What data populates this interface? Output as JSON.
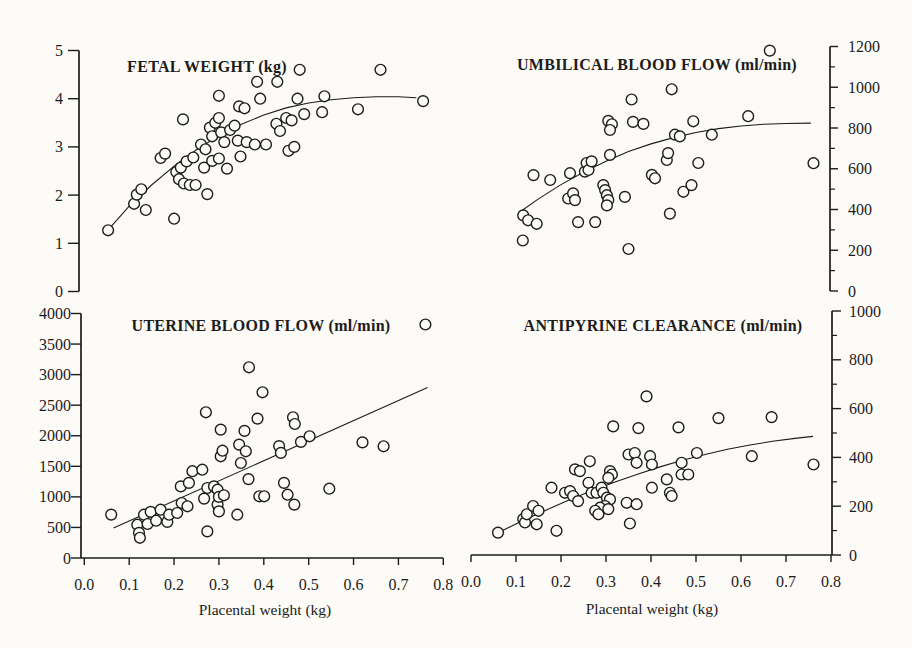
{
  "colors": {
    "ink": "#1c1c1c",
    "paper": "#fcfbf7"
  },
  "chart_data": [
    {
      "type": "scatter",
      "id": "fetal-weight",
      "title": "FETAL WEIGHT (kg)",
      "marker": "open-circle",
      "xlim": [
        0,
        0.8
      ],
      "ylim": [
        0,
        5
      ],
      "yticks": [
        0,
        1,
        2,
        3,
        4,
        5
      ],
      "ytick_labels": [
        "0",
        "1",
        "2",
        "3",
        "4",
        "5"
      ],
      "points": [
        [
          0.053,
          1.27
        ],
        [
          0.111,
          1.82
        ],
        [
          0.117,
          2.01
        ],
        [
          0.127,
          2.12
        ],
        [
          0.137,
          1.69
        ],
        [
          0.2,
          1.51
        ],
        [
          0.17,
          2.77
        ],
        [
          0.18,
          2.86
        ],
        [
          0.205,
          2.48
        ],
        [
          0.215,
          2.57
        ],
        [
          0.228,
          2.7
        ],
        [
          0.243,
          2.78
        ],
        [
          0.211,
          2.33
        ],
        [
          0.222,
          2.24
        ],
        [
          0.235,
          2.21
        ],
        [
          0.248,
          2.21
        ],
        [
          0.274,
          2.02
        ],
        [
          0.267,
          2.57
        ],
        [
          0.285,
          2.71
        ],
        [
          0.22,
          3.57
        ],
        [
          0.26,
          3.05
        ],
        [
          0.27,
          2.95
        ],
        [
          0.28,
          3.4
        ],
        [
          0.285,
          3.22
        ],
        [
          0.292,
          3.5
        ],
        [
          0.3,
          3.6
        ],
        [
          0.305,
          3.3
        ],
        [
          0.312,
          3.1
        ],
        [
          0.3,
          2.76
        ],
        [
          0.318,
          2.55
        ],
        [
          0.325,
          3.35
        ],
        [
          0.335,
          3.44
        ],
        [
          0.342,
          3.13
        ],
        [
          0.348,
          2.8
        ],
        [
          0.362,
          3.1
        ],
        [
          0.38,
          3.05
        ],
        [
          0.405,
          3.05
        ],
        [
          0.428,
          3.48
        ],
        [
          0.436,
          3.33
        ],
        [
          0.45,
          3.6
        ],
        [
          0.462,
          3.55
        ],
        [
          0.455,
          2.92
        ],
        [
          0.468,
          3.0
        ],
        [
          0.49,
          3.68
        ],
        [
          0.53,
          3.72
        ],
        [
          0.61,
          3.78
        ],
        [
          0.3,
          4.06
        ],
        [
          0.345,
          3.84
        ],
        [
          0.357,
          3.8
        ],
        [
          0.385,
          4.35
        ],
        [
          0.392,
          4.0
        ],
        [
          0.43,
          4.35
        ],
        [
          0.475,
          4.0
        ],
        [
          0.48,
          4.6
        ],
        [
          0.535,
          4.05
        ],
        [
          0.66,
          4.6
        ],
        [
          0.755,
          3.95
        ]
      ],
      "curve": [
        [
          0.055,
          1.3
        ],
        [
          0.1,
          1.77
        ],
        [
          0.15,
          2.21
        ],
        [
          0.2,
          2.6
        ],
        [
          0.25,
          2.94
        ],
        [
          0.3,
          3.23
        ],
        [
          0.35,
          3.47
        ],
        [
          0.4,
          3.66
        ],
        [
          0.45,
          3.81
        ],
        [
          0.5,
          3.91
        ],
        [
          0.55,
          3.98
        ],
        [
          0.6,
          4.02
        ],
        [
          0.65,
          4.04
        ],
        [
          0.7,
          4.04
        ],
        [
          0.74,
          4.02
        ]
      ]
    },
    {
      "type": "scatter",
      "id": "umbilical-blood-flow",
      "title": "UMBILICAL BLOOD FLOW (ml/min)",
      "marker": "open-circle",
      "xlim": [
        0,
        0.8
      ],
      "ylim": [
        0,
        1200
      ],
      "yticks": [
        0,
        200,
        400,
        600,
        800,
        1000,
        1200
      ],
      "ytick_labels": [
        "0",
        "200",
        "400",
        "600",
        "800",
        "1000",
        "1200"
      ],
      "yticks_minor": [
        100,
        300,
        500,
        700,
        900,
        1100
      ],
      "points": [
        [
          0.115,
          248
        ],
        [
          0.116,
          371
        ],
        [
          0.127,
          347
        ],
        [
          0.146,
          330
        ],
        [
          0.139,
          569
        ],
        [
          0.176,
          545
        ],
        [
          0.216,
          454
        ],
        [
          0.227,
          479
        ],
        [
          0.231,
          446
        ],
        [
          0.22,
          578
        ],
        [
          0.238,
          338
        ],
        [
          0.276,
          338
        ],
        [
          0.35,
          206
        ],
        [
          0.253,
          586
        ],
        [
          0.257,
          628
        ],
        [
          0.261,
          594
        ],
        [
          0.268,
          636
        ],
        [
          0.294,
          520
        ],
        [
          0.298,
          495
        ],
        [
          0.302,
          470
        ],
        [
          0.305,
          446
        ],
        [
          0.302,
          420
        ],
        [
          0.305,
          835
        ],
        [
          0.313,
          818
        ],
        [
          0.309,
          790
        ],
        [
          0.309,
          668
        ],
        [
          0.342,
          462
        ],
        [
          0.357,
          940
        ],
        [
          0.36,
          830
        ],
        [
          0.383,
          820
        ],
        [
          0.402,
          570
        ],
        [
          0.409,
          553
        ],
        [
          0.435,
          643
        ],
        [
          0.438,
          677
        ],
        [
          0.442,
          380
        ],
        [
          0.446,
          990
        ],
        [
          0.453,
          767
        ],
        [
          0.464,
          759
        ],
        [
          0.472,
          487
        ],
        [
          0.49,
          520
        ],
        [
          0.494,
          833
        ],
        [
          0.505,
          628
        ],
        [
          0.535,
          767
        ],
        [
          0.616,
          858
        ],
        [
          0.664,
          1180
        ],
        [
          0.761,
          627
        ]
      ],
      "curve": [
        [
          0.11,
          390
        ],
        [
          0.15,
          452
        ],
        [
          0.2,
          522
        ],
        [
          0.25,
          583
        ],
        [
          0.3,
          637
        ],
        [
          0.35,
          684
        ],
        [
          0.4,
          722
        ],
        [
          0.45,
          753
        ],
        [
          0.5,
          778
        ],
        [
          0.55,
          797
        ],
        [
          0.6,
          810
        ],
        [
          0.65,
          818
        ],
        [
          0.7,
          822
        ],
        [
          0.755,
          824
        ]
      ]
    },
    {
      "type": "scatter",
      "id": "uterine-blood-flow",
      "title": "UTERINE BLOOD FLOW (ml/min)",
      "marker": "open-circle",
      "xlabel": "Placental weight (kg)",
      "xlim": [
        0,
        0.8
      ],
      "xticks": [
        0,
        0.1,
        0.2,
        0.3,
        0.4,
        0.5,
        0.6,
        0.7,
        0.8
      ],
      "xtick_labels": [
        "0.0",
        "0.1",
        "0.2",
        "0.3",
        "0.4",
        "0.5",
        "0.6",
        "0.7",
        "0.8"
      ],
      "ylim": [
        0,
        4000
      ],
      "yticks": [
        0,
        500,
        1000,
        1500,
        2000,
        2500,
        3000,
        3500,
        4000
      ],
      "ytick_labels": [
        "0",
        "500",
        "1000",
        "1500",
        "2000",
        "2500",
        "3000",
        "3500",
        "4000"
      ],
      "points": [
        [
          0.06,
          710
        ],
        [
          0.118,
          545
        ],
        [
          0.122,
          410
        ],
        [
          0.124,
          330
        ],
        [
          0.133,
          709
        ],
        [
          0.141,
          556
        ],
        [
          0.148,
          755
        ],
        [
          0.16,
          610
        ],
        [
          0.185,
          590
        ],
        [
          0.17,
          791
        ],
        [
          0.189,
          709
        ],
        [
          0.207,
          736
        ],
        [
          0.217,
          900
        ],
        [
          0.23,
          845
        ],
        [
          0.215,
          1172
        ],
        [
          0.233,
          1228
        ],
        [
          0.241,
          1420
        ],
        [
          0.263,
          1445
        ],
        [
          0.267,
          971
        ],
        [
          0.274,
          1146
        ],
        [
          0.289,
          1172
        ],
        [
          0.297,
          1118
        ],
        [
          0.274,
          435
        ],
        [
          0.297,
          873
        ],
        [
          0.3,
          763
        ],
        [
          0.341,
          709
        ],
        [
          0.3,
          1000
        ],
        [
          0.311,
          1025
        ],
        [
          0.366,
          1290
        ],
        [
          0.39,
          1009
        ],
        [
          0.401,
          1009
        ],
        [
          0.304,
          1663
        ],
        [
          0.308,
          1756
        ],
        [
          0.304,
          2100
        ],
        [
          0.357,
          2080
        ],
        [
          0.345,
          1855
        ],
        [
          0.36,
          1745
        ],
        [
          0.349,
          1555
        ],
        [
          0.271,
          2384
        ],
        [
          0.367,
          3120
        ],
        [
          0.386,
          2281
        ],
        [
          0.397,
          2711
        ],
        [
          0.434,
          1830
        ],
        [
          0.438,
          1720
        ],
        [
          0.445,
          1228
        ],
        [
          0.453,
          1036
        ],
        [
          0.468,
          873
        ],
        [
          0.465,
          2302
        ],
        [
          0.469,
          2193
        ],
        [
          0.483,
          1900
        ],
        [
          0.502,
          1991
        ],
        [
          0.546,
          1134
        ],
        [
          0.62,
          1892
        ],
        [
          0.667,
          1827
        ],
        [
          0.76,
          3820
        ]
      ],
      "curve": [
        [
          0.065,
          490
        ],
        [
          0.765,
          2790
        ]
      ]
    },
    {
      "type": "scatter",
      "id": "antipyrine-clearance",
      "title": "ANTIPYRINE CLEARANCE (ml/min)",
      "marker": "open-circle",
      "xlabel": "Placental weight (kg)",
      "xlim": [
        0,
        0.8
      ],
      "xticks": [
        0,
        0.1,
        0.2,
        0.3,
        0.4,
        0.5,
        0.6,
        0.7,
        0.8
      ],
      "xtick_labels": [
        "0.0",
        "0.1",
        "0.2",
        "0.3",
        "0.4",
        "0.5",
        "0.6",
        "0.7",
        "0.8"
      ],
      "ylim": [
        0,
        1000
      ],
      "yticks": [
        0,
        200,
        400,
        600,
        800,
        1000
      ],
      "ytick_labels": [
        "0",
        "200",
        "400",
        "600",
        "800",
        "1000"
      ],
      "yticks_minor": [
        100,
        300,
        500,
        700,
        900
      ],
      "points": [
        [
          0.06,
          92
        ],
        [
          0.116,
          147
        ],
        [
          0.12,
          133
        ],
        [
          0.124,
          167
        ],
        [
          0.138,
          201
        ],
        [
          0.146,
          126
        ],
        [
          0.15,
          181
        ],
        [
          0.179,
          276
        ],
        [
          0.19,
          99
        ],
        [
          0.209,
          255
        ],
        [
          0.22,
          262
        ],
        [
          0.227,
          242
        ],
        [
          0.238,
          221
        ],
        [
          0.231,
          351
        ],
        [
          0.242,
          344
        ],
        [
          0.264,
          384
        ],
        [
          0.261,
          296
        ],
        [
          0.268,
          255
        ],
        [
          0.279,
          255
        ],
        [
          0.29,
          276
        ],
        [
          0.294,
          255
        ],
        [
          0.302,
          235
        ],
        [
          0.309,
          228
        ],
        [
          0.298,
          201
        ],
        [
          0.287,
          194
        ],
        [
          0.305,
          188
        ],
        [
          0.276,
          181
        ],
        [
          0.283,
          167
        ],
        [
          0.309,
          344
        ],
        [
          0.313,
          330
        ],
        [
          0.305,
          316
        ],
        [
          0.316,
          527
        ],
        [
          0.372,
          520
        ],
        [
          0.39,
          650
        ],
        [
          0.461,
          523
        ],
        [
          0.346,
          214
        ],
        [
          0.368,
          208
        ],
        [
          0.353,
          129
        ],
        [
          0.35,
          412
        ],
        [
          0.364,
          418
        ],
        [
          0.368,
          378
        ],
        [
          0.398,
          405
        ],
        [
          0.402,
          371
        ],
        [
          0.402,
          276
        ],
        [
          0.435,
          310
        ],
        [
          0.442,
          255
        ],
        [
          0.446,
          242
        ],
        [
          0.468,
          378
        ],
        [
          0.468,
          330
        ],
        [
          0.483,
          330
        ],
        [
          0.502,
          418
        ],
        [
          0.55,
          561
        ],
        [
          0.624,
          405
        ],
        [
          0.668,
          565
        ],
        [
          0.761,
          371
        ]
      ],
      "curve": [
        [
          0.07,
          100
        ],
        [
          0.12,
          145
        ],
        [
          0.17,
          187
        ],
        [
          0.22,
          227
        ],
        [
          0.27,
          264
        ],
        [
          0.32,
          299
        ],
        [
          0.37,
          331
        ],
        [
          0.42,
          361
        ],
        [
          0.47,
          388
        ],
        [
          0.52,
          412
        ],
        [
          0.57,
          433
        ],
        [
          0.62,
          451
        ],
        [
          0.67,
          466
        ],
        [
          0.72,
          478
        ],
        [
          0.76,
          486
        ]
      ]
    }
  ]
}
